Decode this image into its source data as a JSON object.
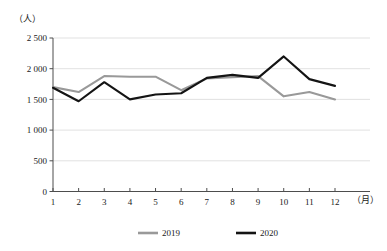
{
  "chart_data": {
    "type": "line",
    "title": "",
    "xlabel": "（月）",
    "ylabel": "（人）",
    "categories": [
      "1",
      "2",
      "3",
      "4",
      "5",
      "6",
      "7",
      "8",
      "9",
      "10",
      "11",
      "12"
    ],
    "ylim": [
      0,
      2500
    ],
    "yticks": [
      0,
      500,
      1000,
      1500,
      2000,
      2500
    ],
    "ytick_labels": [
      "0",
      "500",
      "1 000",
      "1 500",
      "2 000",
      "2 500"
    ],
    "grid": true,
    "legend_position": "bottom-center",
    "series": [
      {
        "name": "2019",
        "color": "#999999",
        "values": [
          1700,
          1620,
          1880,
          1870,
          1870,
          1650,
          1840,
          1860,
          1880,
          1550,
          1620,
          1500
        ]
      },
      {
        "name": "2020",
        "color": "#141414",
        "values": [
          1690,
          1470,
          1780,
          1500,
          1580,
          1600,
          1850,
          1900,
          1850,
          2200,
          1830,
          1720
        ]
      }
    ]
  },
  "legend": {
    "items": [
      {
        "label": "2019",
        "color": "#999999"
      },
      {
        "label": "2020",
        "color": "#141414"
      }
    ]
  },
  "axes": {
    "y_unit": "（人）",
    "x_unit": "（月）"
  }
}
